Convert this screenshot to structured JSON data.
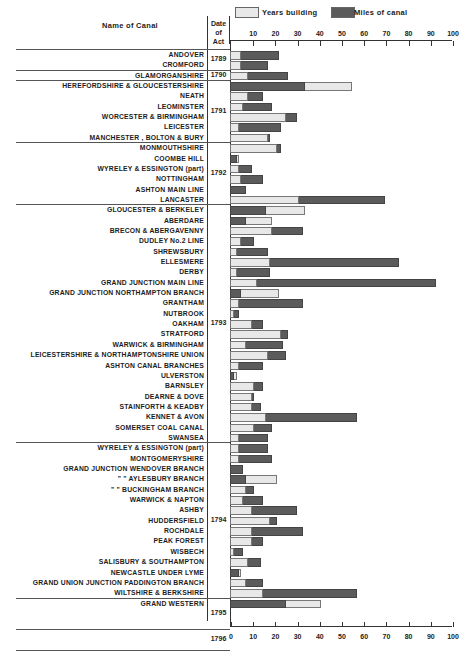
{
  "header": {
    "name_col": "Name of Canal",
    "date_col_line1": "Date",
    "date_col_line2": "of",
    "date_col_line3": "Act"
  },
  "legend": {
    "years_label": "Years building",
    "miles_label": "Miles of canal",
    "years_color": "#e8e8e8",
    "miles_color": "#5b5b5b"
  },
  "axis": {
    "top_ticks": [
      "10",
      "20",
      "30",
      "40",
      "50",
      "60",
      "70",
      "80",
      "90",
      "100"
    ],
    "bottom_ticks": [
      "0",
      "10",
      "20",
      "30",
      "40",
      "50",
      "60",
      "70",
      "80",
      "90",
      "100"
    ]
  },
  "year_groups": [
    {
      "year": "1789",
      "first_row": 0,
      "last_row": 1
    },
    {
      "year": "1790",
      "first_row": 2,
      "last_row": 2
    },
    {
      "year": "1791",
      "first_row": 3,
      "last_row": 8
    },
    {
      "year": "1792",
      "first_row": 9,
      "last_row": 14
    },
    {
      "year": "1793",
      "first_row": 15,
      "last_row": 37
    },
    {
      "year": "1794",
      "first_row": 38,
      "last_row": 52
    },
    {
      "year": "1795",
      "first_row": 53,
      "last_row": 55
    },
    {
      "year": "1796",
      "first_row": 56,
      "last_row": 57
    }
  ],
  "chart_data": {
    "type": "bar",
    "orientation": "horizontal",
    "title": "",
    "xlabel": "",
    "ylabel": "Name of Canal",
    "xlim": [
      0,
      100
    ],
    "legend": [
      "Years building",
      "Miles of canal"
    ],
    "legend_position": "top",
    "grid": false,
    "categories": [
      "ANDOVER",
      "CROMFORD",
      "GLAMORGANSHIRE",
      "HEREFORDSHIRE & GLOUCESTERSHIRE",
      "NEATH",
      "LEOMINSTER",
      "WORCESTER & BIRMINGHAM",
      "LEICESTER",
      "MANCHESTER , BOLTON & BURY",
      "MONMOUTHSHIRE",
      "COOMBE HILL",
      "WYRELEY & ESSINGTON (part)",
      "NOTTINGHAM",
      "ASHTON MAIN LINE",
      "LANCASTER",
      "GLOUCESTER & BERKELEY",
      "ABERDARE",
      "BRECON & ABERGAVENNY",
      "DUDLEY No.2 LINE",
      "SHREWSBURY",
      "ELLESMERE",
      "DERBY",
      "GRAND JUNCTION MAIN LINE",
      "GRAND JUNCTION NORTHAMPTON BRANCH",
      "GRANTHAM",
      "NUTBROOK",
      "OAKHAM",
      "STRATFORD",
      "WARWICK & BIRMINGHAM",
      "LEICESTERSHIRE & NORTHAMPTONSHIRE UNION",
      "ASHTON CANAL BRANCHES",
      "ULVERSTON",
      "BARNSLEY",
      "DEARNE & DOVE",
      "STAINFORTH & KEADBY",
      "KENNET & AVON",
      "SOMERSET COAL CANAL",
      "SWANSEA",
      "WYRELEY & ESSINGTON (part)",
      "MONTGOMERYSHIRE",
      "GRAND JUNCTION WENDOVER BRANCH",
      "\"     \"     AYLESBURY BRANCH",
      "\"     \"     BUCKINGHAM BRANCH",
      "WARWICK & NAPTON",
      "ASHBY",
      "HUDDERSFIELD",
      "ROCHDALE",
      "PEAK FOREST",
      "WISBECH",
      "SALISBURY & SOUTHAMPTON",
      "NEWCASTLE UNDER LYME",
      "GRAND UNION JUNCTION PADDINGTON BRANCH",
      "WILTSHIRE & BERKSHIRE",
      "GRAND WESTERN"
    ],
    "date_of_act": [
      "1789",
      "1789",
      "1790",
      "1791",
      "1791",
      "1791",
      "1791",
      "1791",
      "1791",
      "1792",
      "1792",
      "1792",
      "1792",
      "1792",
      "1792",
      "1793",
      "1793",
      "1793",
      "1793",
      "1793",
      "1793",
      "1793",
      "1793",
      "1793",
      "1793",
      "1793",
      "1793",
      "1793",
      "1793",
      "1793",
      "1793",
      "1793",
      "1793",
      "1793",
      "1793",
      "1794",
      "1794",
      "1794",
      "1794",
      "1794",
      "1794",
      "1794",
      "1794",
      "1794",
      "1794",
      "1794",
      "1794",
      "1794",
      "1794",
      "1795",
      "1795",
      "1795",
      "1796",
      "1796"
    ],
    "series": [
      {
        "name": "Years building",
        "values": [
          5,
          5,
          8,
          55,
          8,
          6,
          25,
          4,
          17,
          21,
          4,
          4,
          5,
          0,
          31,
          34,
          19,
          19,
          5,
          3,
          18,
          3,
          12,
          22,
          4,
          2,
          10,
          23,
          7,
          17,
          4,
          3,
          11,
          10,
          10,
          16,
          11,
          4,
          4,
          4,
          0,
          21,
          7,
          6,
          10,
          18,
          10,
          10,
          2,
          8,
          5,
          7,
          15,
          41
        ]
      },
      {
        "name": "Miles of canal",
        "values": [
          22,
          17,
          26,
          34,
          15,
          19,
          30,
          23,
          18,
          23,
          3,
          10,
          15,
          7,
          70,
          16,
          7,
          33,
          11,
          17,
          76,
          18,
          93,
          5,
          33,
          4,
          15,
          26,
          24,
          25,
          15,
          2,
          15,
          11,
          14,
          57,
          19,
          17,
          17,
          19,
          6,
          7,
          11,
          15,
          30,
          21,
          33,
          15,
          6,
          14,
          4,
          15,
          57,
          25
        ]
      }
    ]
  }
}
